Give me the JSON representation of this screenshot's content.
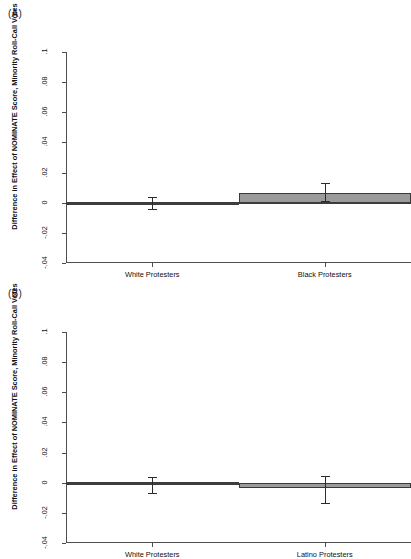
{
  "figure": {
    "panel_a_label": "(A)",
    "panel_b_label": "(B)",
    "ylabel": "Difference in Effect of NOMINATE Score, Minority Roll-Call Votes"
  },
  "axis": {
    "yticks": [
      ".1",
      ".08",
      ".06",
      ".04",
      ".02",
      "0",
      "-.02",
      "-.04"
    ],
    "ymin": -0.04,
    "ymax": 0.1
  },
  "chart_data": [
    {
      "type": "bar",
      "panel": "(A)",
      "title": "",
      "xlabel": "",
      "ylabel": "Difference in Effect of NOMINATE Score, Minority Roll-Call Votes",
      "categories": [
        "White Protesters",
        "Black Protesters"
      ],
      "values": [
        0.0,
        0.0065
      ],
      "error_low": [
        -0.004,
        0.0012
      ],
      "error_high": [
        0.004,
        0.013
      ],
      "ylim": [
        -0.04,
        0.1
      ],
      "yticks": [
        -0.04,
        -0.02,
        0,
        0.02,
        0.04,
        0.06,
        0.08,
        0.1
      ],
      "ytick_labels": [
        "-.04",
        "-.02",
        "0",
        ".02",
        ".04",
        ".06",
        ".08",
        ".1"
      ],
      "grid": false,
      "legend": "none",
      "bar_fill": "#9b9b9b",
      "bar_edge": "#3a3a3a"
    },
    {
      "type": "bar",
      "panel": "(B)",
      "title": "",
      "xlabel": "",
      "ylabel": "Difference in Effect of NOMINATE Score, Minority Roll-Call Votes",
      "categories": [
        "White Protesters",
        "Latino Protesters"
      ],
      "values": [
        -0.0005,
        -0.0036
      ],
      "error_low": [
        -0.007,
        -0.0135
      ],
      "error_high": [
        0.0035,
        0.0045
      ],
      "ylim": [
        -0.04,
        0.1
      ],
      "yticks": [
        -0.04,
        -0.02,
        0,
        0.02,
        0.04,
        0.06,
        0.08,
        0.1
      ],
      "ytick_labels": [
        "-.04",
        "-.02",
        "0",
        ".02",
        ".04",
        ".06",
        ".08",
        ".1"
      ],
      "grid": false,
      "legend": "none",
      "bar_fill": "#9b9b9b",
      "bar_edge": "#3a3a3a"
    }
  ]
}
